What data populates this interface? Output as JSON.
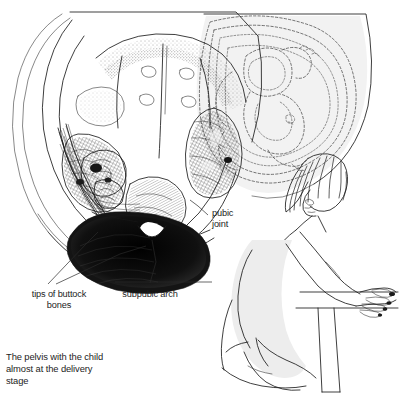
{
  "figure": {
    "title_caption": {
      "line1": "The pelvis with the child",
      "line2": "almost at the delivery",
      "line3": "stage"
    },
    "labels": [
      {
        "id": "pubic-joint",
        "line1": "pubic",
        "line2": "joint"
      },
      {
        "id": "tips-of-buttock-bones",
        "line1": "tips of buttock",
        "line2": "bones"
      },
      {
        "id": "subpubic-arch",
        "line1": "subpubic arch",
        "line2": ""
      }
    ],
    "illustration": {
      "name": "pelvis-cross-section-with-fetus",
      "description": "Anatomical line drawing, view from below of the bony pelvis with the fetus in position",
      "inset_name": "kneeling-pregnant-woman",
      "inset_description": "Side view of a pregnant woman kneeling and leaning forward with hands resting on a bar"
    },
    "colors": {
      "ink": "#1c1c1c",
      "background": "#ffffff",
      "tint": "#f2f2f2",
      "dark_mass": "#141414",
      "text": "#1d1d1d"
    }
  }
}
